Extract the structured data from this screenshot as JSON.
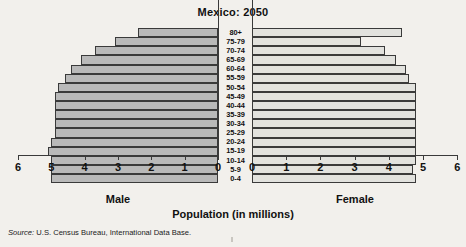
{
  "chart_data": {
    "type": "bar",
    "subtype": "population-pyramid",
    "title": "Mexico: 2050",
    "xlabel": "Population (in millions)",
    "ylabel": "",
    "xlim": [
      0,
      6
    ],
    "xticks": [
      0,
      1,
      2,
      3,
      4,
      5,
      6
    ],
    "grid": false,
    "legend": "none",
    "categories": [
      "80+",
      "75-79",
      "70-74",
      "65-69",
      "60-64",
      "55-59",
      "50-54",
      "45-49",
      "40-44",
      "35-39",
      "30-34",
      "25-29",
      "20-24",
      "15-19",
      "10-14",
      "5-9",
      "0-4"
    ],
    "series": [
      {
        "name": "Male",
        "side": "left",
        "color": "#b9b9b9",
        "values": [
          2.4,
          3.1,
          3.7,
          4.1,
          4.4,
          4.6,
          4.8,
          4.9,
          4.9,
          4.9,
          4.9,
          4.9,
          5.0,
          5.1,
          5.0,
          5.0,
          5.0
        ]
      },
      {
        "name": "Female",
        "side": "right",
        "color": "#e2e2de",
        "values": [
          4.4,
          3.2,
          3.9,
          4.2,
          4.5,
          4.6,
          4.8,
          4.8,
          4.8,
          4.8,
          4.8,
          4.8,
          4.8,
          4.8,
          4.8,
          4.7,
          4.8
        ]
      }
    ],
    "axis_labels": {
      "left": "Male",
      "right": "Female"
    },
    "left_tick_labels": [
      "6",
      "5",
      "4",
      "3",
      "2",
      "1",
      "0"
    ],
    "right_tick_labels": [
      "0",
      "1",
      "2",
      "3",
      "4",
      "5",
      "6"
    ]
  },
  "source": {
    "prefix": "Source:",
    "text": " U.S. Census Bureau, International Data Base."
  },
  "colors": {
    "background": "#f2f0ec",
    "male_bar": "#b9b9b9",
    "female_bar": "#e2e2de",
    "outline": "#3a3a3a"
  }
}
